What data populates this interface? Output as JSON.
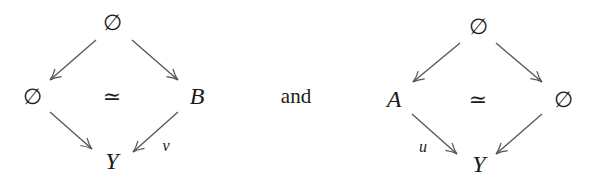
{
  "conjunction": "and",
  "diagrams": [
    {
      "nodes": {
        "top": "∅",
        "left": "∅",
        "right": "B",
        "bottom": "Y"
      },
      "center": "≃",
      "labels": {
        "right_to_bottom": "v"
      }
    },
    {
      "nodes": {
        "top": "∅",
        "left": "A",
        "right": "∅",
        "bottom": "Y"
      },
      "center": "≃",
      "labels": {
        "left_to_bottom": "u"
      }
    }
  ],
  "colors": {
    "arrow": "#555555",
    "text": "#1a1a1a"
  }
}
